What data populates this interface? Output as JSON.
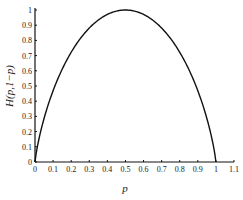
{
  "chart_data": {
    "type": "line",
    "title": "",
    "xlabel": "p",
    "ylabel": "H(p,1−p)",
    "xlim": [
      0,
      1.1
    ],
    "ylim": [
      0,
      1
    ],
    "grid": false,
    "legend": null,
    "x_ticks": [
      "0",
      "0.1",
      "0.2",
      "0.3",
      "0.4",
      "0.5",
      "0.6",
      "0.7",
      "0.8",
      "0.9",
      "1",
      "1.1"
    ],
    "y_ticks": [
      "0",
      "0.1",
      "0.2",
      "0.3",
      "0.4",
      "0.5",
      "0.6",
      "0.7",
      "0.8",
      "0.9",
      "1"
    ],
    "series": [
      {
        "name": "binary entropy",
        "x": [
          0,
          0.01,
          0.05,
          0.1,
          0.15,
          0.2,
          0.25,
          0.3,
          0.35,
          0.4,
          0.45,
          0.5,
          0.55,
          0.6,
          0.65,
          0.7,
          0.75,
          0.8,
          0.85,
          0.9,
          0.95,
          0.99,
          1.0
        ],
        "y": [
          0,
          0.081,
          0.286,
          0.469,
          0.61,
          0.722,
          0.811,
          0.881,
          0.934,
          0.971,
          0.993,
          1.0,
          0.993,
          0.971,
          0.934,
          0.881,
          0.811,
          0.722,
          0.61,
          0.469,
          0.286,
          0.081,
          0
        ]
      }
    ]
  }
}
